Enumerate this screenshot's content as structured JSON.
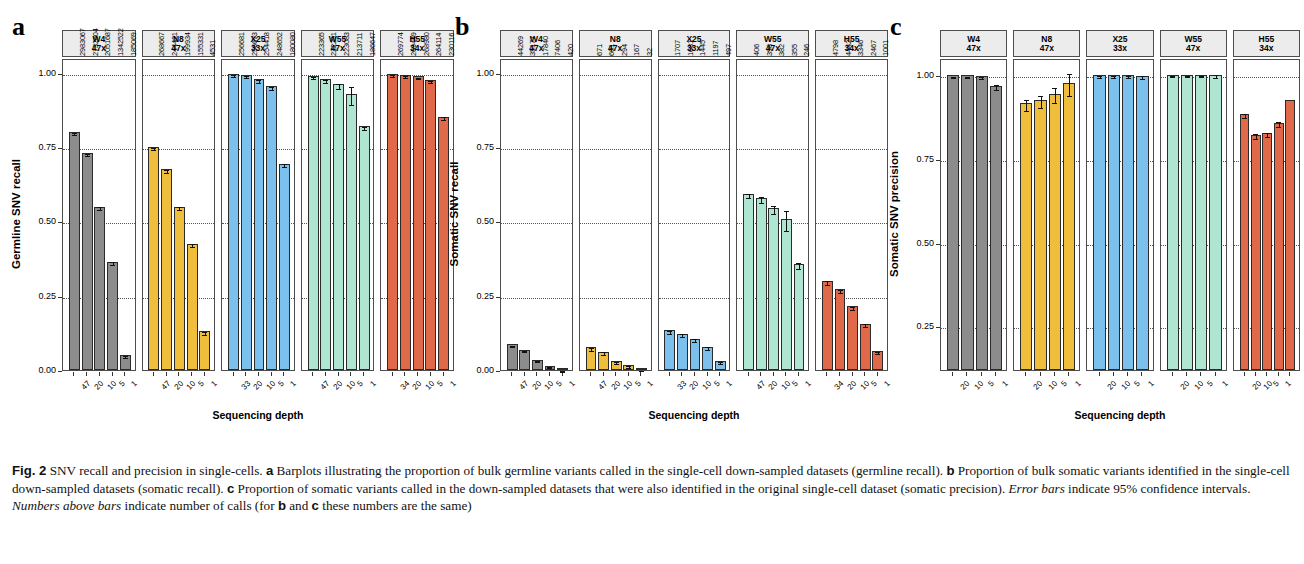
{
  "figure": {
    "panels": [
      {
        "letter": "a",
        "ylabel": "Germline SNV recall",
        "xlabel": "Sequencing depth",
        "yticks": [
          "0.00",
          "0.25",
          "0.50",
          "0.75",
          "1.00"
        ],
        "groups": [
          {
            "name": "W4",
            "coverage": "47x",
            "color": "#8c8c8c",
            "depths": [
              "47",
              "20",
              "10",
              "5",
              "1"
            ],
            "values": [
              0.8,
              0.73,
              0.55,
              0.365,
              0.05
            ],
            "errors": [
              0.004,
              0.004,
              0.004,
              0.004,
              0.004
            ],
            "counts": [
              "2983067",
              "2732604",
              "2051687",
              "1342522",
              "185069"
            ]
          },
          {
            "name": "N8",
            "coverage": "47x",
            "color": "#efbe3d",
            "depths": [
              "47",
              "20",
              "10",
              "5",
              "1"
            ],
            "values": [
              0.75,
              0.675,
              0.55,
              0.425,
              0.13
            ],
            "errors": [
              0.004,
              0.004,
              0.004,
              0.006,
              0.004
            ],
            "counts": [
              "268667",
              "244421",
              "199934",
              "155331",
              "4531"
            ]
          },
          {
            "name": "X25",
            "coverage": "33x",
            "color": "#7cc0ee",
            "depths": [
              "33",
              "20",
              "10",
              "5",
              "1"
            ],
            "values": [
              0.995,
              0.993,
              0.978,
              0.955,
              0.695
            ],
            "errors": [
              0.003,
              0.003,
              0.004,
              0.005,
              0.006
            ],
            "counts": [
              "256681",
              "256673",
              "254418",
              "248652",
              "180080"
            ]
          },
          {
            "name": "W55",
            "coverage": "47x",
            "color": "#aee6d2",
            "depths": [
              "47",
              "20",
              "10",
              "5",
              "1"
            ],
            "values": [
              0.99,
              0.978,
              0.962,
              0.928,
              0.82
            ],
            "errors": [
              0.004,
              0.006,
              0.008,
              0.031,
              0.006
            ],
            "counts": [
              "223365",
              "222291",
              "223083",
              "213711",
              "186647"
            ]
          },
          {
            "name": "H55",
            "coverage": "34x",
            "color": "#e0694a",
            "depths": [
              "34",
              "20",
              "10",
              "5",
              "1"
            ],
            "values": [
              0.995,
              0.992,
              0.988,
              0.975,
              0.852
            ],
            "errors": [
              0.003,
              0.003,
              0.003,
              0.004,
              0.005
            ],
            "counts": [
              "269774",
              "269449",
              "268980",
              "264114",
              "230116"
            ]
          }
        ]
      },
      {
        "letter": "b",
        "ylabel": "Somatic SNV recall",
        "xlabel": "Sequencing depth",
        "yticks": [
          "0.00",
          "0.25",
          "0.50",
          "0.75",
          "1.00"
        ],
        "groups": [
          {
            "name": "W4",
            "coverage": "47x",
            "color": "#8c8c8c",
            "depths": [
              "47",
              "20",
              "10",
              "5",
              "1"
            ],
            "values": [
              0.086,
              0.069,
              0.034,
              0.014,
              0.001
            ],
            "errors": [
              0.003,
              0.003,
              0.002,
              0.002,
              0.001
            ],
            "counts": [
              "44269",
              "35177",
              "17840",
              "7406",
              "420"
            ]
          },
          {
            "name": "N8",
            "coverage": "47x",
            "color": "#efbe3d",
            "depths": [
              "47",
              "20",
              "10",
              "5",
              "1"
            ],
            "values": [
              0.076,
              0.062,
              0.031,
              0.017,
              0.003
            ],
            "errors": [
              0.004,
              0.004,
              0.003,
              0.002,
              0.001
            ],
            "counts": [
              "671",
              "601",
              "294",
              "167",
              "32"
            ]
          },
          {
            "name": "X25",
            "coverage": "33x",
            "color": "#7cc0ee",
            "depths": [
              "33",
              "20",
              "10",
              "5",
              "1"
            ],
            "values": [
              0.133,
              0.122,
              0.105,
              0.079,
              0.031
            ],
            "errors": [
              0.005,
              0.005,
              0.005,
              0.004,
              0.003
            ],
            "counts": [
              "1707",
              "1681",
              "1445",
              "1197",
              "497"
            ]
          },
          {
            "name": "W55",
            "coverage": "47x",
            "color": "#aee6d2",
            "depths": [
              "47",
              "20",
              "10",
              "5",
              "1"
            ],
            "values": [
              0.592,
              0.578,
              0.545,
              0.508,
              0.357
            ],
            "errors": [
              0.008,
              0.01,
              0.013,
              0.035,
              0.01
            ],
            "counts": [
              "406",
              "398",
              "382",
              "355",
              "246"
            ]
          },
          {
            "name": "H55",
            "coverage": "34x",
            "color": "#e0694a",
            "depths": [
              "34",
              "20",
              "10",
              "5",
              "1"
            ],
            "values": [
              0.299,
              0.271,
              0.214,
              0.156,
              0.065
            ],
            "errors": [
              0.006,
              0.006,
              0.005,
              0.005,
              0.003
            ],
            "counts": [
              "4798",
              "4442",
              "3346",
              "2467",
              "1001"
            ]
          }
        ]
      },
      {
        "letter": "c",
        "ylabel": "Somatic SNV precision",
        "xlabel": "Sequencing depth",
        "yticks": [
          "0.25",
          "0.50",
          "0.75",
          "1.00"
        ],
        "groups": [
          {
            "name": "W4",
            "coverage": "47x",
            "color": "#8c8c8c",
            "depths": [
              "20",
              "10",
              "5",
              "1"
            ],
            "values": [
              0.998,
              0.998,
              0.997,
              0.968
            ],
            "errors": [
              0.002,
              0.002,
              0.003,
              0.008
            ],
            "counts": []
          },
          {
            "name": "N8",
            "coverage": "47x",
            "color": "#efbe3d",
            "depths": [
              "20",
              "10",
              "5",
              "1"
            ],
            "values": [
              0.915,
              0.925,
              0.944,
              0.975
            ],
            "errors": [
              0.017,
              0.019,
              0.023,
              0.032
            ],
            "counts": []
          },
          {
            "name": "X25",
            "coverage": "33x",
            "color": "#7cc0ee",
            "depths": [
              "20",
              "10",
              "5",
              "1"
            ],
            "values": [
              0.998,
              0.999,
              0.999,
              0.997
            ],
            "errors": [
              0.003,
              0.003,
              0.003,
              0.004
            ],
            "counts": []
          },
          {
            "name": "W55",
            "coverage": "47x",
            "color": "#aee6d2",
            "depths": [
              "20",
              "10",
              "5",
              "1"
            ],
            "values": [
              1.0,
              1.0,
              1.0,
              1.0
            ],
            "errors": [
              0.002,
              0.002,
              0.002,
              0.004
            ],
            "counts": []
          },
          {
            "name": "H55",
            "coverage": "34x",
            "color": "#e0694a",
            "depths": [
              "20",
              "10",
              "5",
              "1"
            ],
            "values": [
              0.884,
              0.822,
              0.826,
              0.857,
              0.925
            ],
            "errors": [
              0.006,
              0.007,
              0.007,
              0.008
            ],
            "counts": []
          }
        ]
      }
    ]
  },
  "caption": {
    "fig_label": "Fig. 2",
    "text_1": "SNV recall and precision in single-cells. ",
    "b1": "a",
    "text_2": " Barplots illustrating the proportion of bulk germline variants called in the single-cell down-sampled datasets (germline recall). ",
    "b2": "b",
    "text_3": " Proportion of bulk somatic variants identified in the single-cell down-sampled datasets (somatic recall). ",
    "b3": "c",
    "text_4": " Proportion of somatic variants called in the down-sampled datasets that were also identified in the original single-cell dataset (somatic precision). ",
    "i1": "Error bars",
    "text_5": " indicate 95% confidence intervals. ",
    "i2": "Numbers above bars",
    "text_6": " indicate number of calls (for ",
    "b4": "b",
    "text_7": " and ",
    "b5": "c",
    "text_8": " these numbers are the same)"
  },
  "chart_data": [
    {
      "type": "bar",
      "title": "a",
      "ylabel": "Germline SNV recall",
      "xlabel": "Sequencing depth",
      "ylim": [
        0,
        1.05
      ],
      "yticks": [
        0.0,
        0.25,
        0.5,
        0.75,
        1.0
      ],
      "grid": true,
      "legend": "none",
      "facets": [
        "W4 47x",
        "N8 47x",
        "X25 33x",
        "W55 47x",
        "H55 34x"
      ],
      "series": [
        {
          "name": "W4",
          "categories": [
            47,
            20,
            10,
            5,
            1
          ],
          "values": [
            0.8,
            0.73,
            0.55,
            0.365,
            0.05
          ],
          "labels": [
            2983067,
            2732604,
            2051687,
            1342522,
            185069
          ]
        },
        {
          "name": "N8",
          "categories": [
            47,
            20,
            10,
            5,
            1
          ],
          "values": [
            0.75,
            0.675,
            0.55,
            0.425,
            0.13
          ],
          "labels": [
            268667,
            244421,
            199934,
            155331,
            4531
          ]
        },
        {
          "name": "X25",
          "categories": [
            33,
            20,
            10,
            5,
            1
          ],
          "values": [
            0.995,
            0.993,
            0.978,
            0.955,
            0.695
          ],
          "labels": [
            256681,
            256673,
            254418,
            248652,
            180080
          ]
        },
        {
          "name": "W55",
          "categories": [
            47,
            20,
            10,
            5,
            1
          ],
          "values": [
            0.99,
            0.978,
            0.962,
            0.928,
            0.82
          ],
          "labels": [
            223365,
            222291,
            223083,
            213711,
            186647
          ]
        },
        {
          "name": "H55",
          "categories": [
            34,
            20,
            10,
            5,
            1
          ],
          "values": [
            0.995,
            0.992,
            0.988,
            0.975,
            0.852
          ],
          "labels": [
            269774,
            269449,
            268980,
            264114,
            230116
          ]
        }
      ]
    },
    {
      "type": "bar",
      "title": "b",
      "ylabel": "Somatic SNV recall",
      "xlabel": "Sequencing depth",
      "ylim": [
        0,
        1.05
      ],
      "yticks": [
        0.0,
        0.25,
        0.5,
        0.75,
        1.0
      ],
      "grid": true,
      "legend": "none",
      "facets": [
        "W4 47x",
        "N8 47x",
        "X25 33x",
        "W55 47x",
        "H55 34x"
      ],
      "series": [
        {
          "name": "W4",
          "categories": [
            47,
            20,
            10,
            5,
            1
          ],
          "values": [
            0.086,
            0.069,
            0.034,
            0.014,
            0.001
          ],
          "labels": [
            44269,
            35177,
            17840,
            7406,
            420
          ]
        },
        {
          "name": "N8",
          "categories": [
            47,
            20,
            10,
            5,
            1
          ],
          "values": [
            0.076,
            0.062,
            0.031,
            0.017,
            0.003
          ],
          "labels": [
            671,
            601,
            294,
            167,
            32
          ]
        },
        {
          "name": "X25",
          "categories": [
            33,
            20,
            10,
            5,
            1
          ],
          "values": [
            0.133,
            0.122,
            0.105,
            0.079,
            0.031
          ],
          "labels": [
            1707,
            1681,
            1445,
            1197,
            497
          ]
        },
        {
          "name": "W55",
          "categories": [
            47,
            20,
            10,
            5,
            1
          ],
          "values": [
            0.592,
            0.578,
            0.545,
            0.508,
            0.357
          ],
          "labels": [
            406,
            398,
            382,
            355,
            246
          ]
        },
        {
          "name": "H55",
          "categories": [
            34,
            20,
            10,
            5,
            1
          ],
          "values": [
            0.299,
            0.271,
            0.214,
            0.156,
            0.065
          ],
          "labels": [
            4798,
            4442,
            3346,
            2467,
            1001
          ]
        }
      ]
    },
    {
      "type": "bar",
      "title": "c",
      "ylabel": "Somatic SNV precision",
      "xlabel": "Sequencing depth",
      "ylim": [
        0.12,
        1.05
      ],
      "yticks": [
        0.25,
        0.5,
        0.75,
        1.0
      ],
      "grid": true,
      "legend": "none",
      "facets": [
        "W4 47x",
        "N8 47x",
        "X25 33x",
        "W55 47x",
        "H55 34x"
      ],
      "series": [
        {
          "name": "W4",
          "categories": [
            20,
            10,
            5,
            1
          ],
          "values": [
            0.998,
            0.998,
            0.997,
            0.968
          ]
        },
        {
          "name": "N8",
          "categories": [
            20,
            10,
            5,
            1
          ],
          "values": [
            0.915,
            0.925,
            0.944,
            0.975
          ]
        },
        {
          "name": "X25",
          "categories": [
            20,
            10,
            5,
            1
          ],
          "values": [
            0.998,
            0.999,
            0.999,
            0.997
          ]
        },
        {
          "name": "W55",
          "categories": [
            20,
            10,
            5,
            1
          ],
          "values": [
            1.0,
            1.0,
            1.0,
            1.0
          ]
        },
        {
          "name": "H55",
          "categories": [
            20,
            10,
            5,
            1
          ],
          "values": [
            0.884,
            0.822,
            0.857,
            0.925
          ]
        }
      ]
    }
  ]
}
